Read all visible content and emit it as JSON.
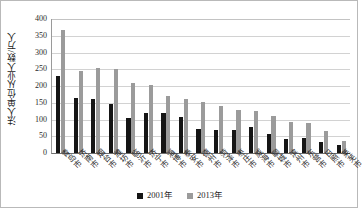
{
  "chart_data": {
    "type": "bar",
    "title": "",
    "xlabel": "",
    "ylabel": "法人单位从业人数/万人",
    "ylim": [
      0,
      400
    ],
    "ytick_step": 50,
    "yticks": [
      "400",
      "350",
      "300",
      "250",
      "200",
      "150",
      "100",
      "50",
      "0"
    ],
    "grid": true,
    "legend_position": "bottom-center",
    "categories": [
      "青岛市",
      "济南市",
      "烟台市",
      "潍坊市",
      "临沂市",
      "济宁市",
      "淄博市",
      "泰安市",
      "德州市",
      "菏泽市",
      "枣庄市",
      "威海市",
      "聊城市",
      "滨州市",
      "东营市",
      "日照市",
      "莱芜市"
    ],
    "series": [
      {
        "name": "2001年",
        "color": "#151515",
        "values": [
          229,
          163,
          160,
          147,
          105,
          118,
          118,
          107,
          71,
          70,
          68,
          77,
          58,
          41,
          44,
          34,
          23
        ]
      },
      {
        "name": "2013年",
        "color": "#9b9b9b",
        "values": [
          367,
          245,
          255,
          252,
          208,
          204,
          169,
          161,
          151,
          140,
          129,
          126,
          110,
          94,
          89,
          67,
          37
        ]
      }
    ]
  }
}
